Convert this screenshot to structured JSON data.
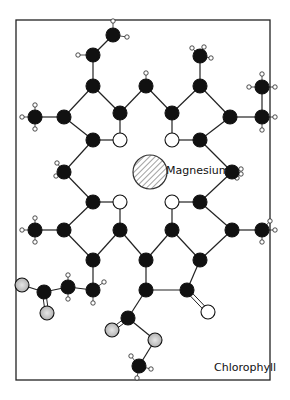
{
  "title": "Chlorophyll",
  "center_label": "Magnesium",
  "frame": {
    "x": 16,
    "y": 20,
    "w": 254,
    "h": 360
  },
  "colors": {
    "carbon": "#111111",
    "nitrogen": "#ffffff",
    "oxygen_ester": "#c8c8c8",
    "oxygen_carbonyl": "#ffffff",
    "hydrogen": "#ffffff",
    "bond": "#222222",
    "frame": "#222222"
  },
  "legend": {
    "atom_types": [
      "Carbon (black)",
      "Nitrogen (white)",
      "Oxygen (grey/white)",
      "Hydrogen (small white)",
      "Magnesium (hatched)"
    ]
  },
  "atoms": [
    {
      "id": "v2",
      "x": 113,
      "y": 35,
      "type": "C"
    },
    {
      "id": "v1",
      "x": 93,
      "y": 55,
      "type": "C"
    },
    {
      "id": "a1",
      "x": 93,
      "y": 86,
      "type": "C"
    },
    {
      "id": "a2",
      "x": 120,
      "y": 113,
      "type": "C"
    },
    {
      "id": "m1",
      "x": 146,
      "y": 86,
      "type": "C"
    },
    {
      "id": "b1",
      "x": 172,
      "y": 113,
      "type": "C"
    },
    {
      "id": "b2",
      "x": 200,
      "y": 86,
      "type": "C"
    },
    {
      "id": "bm",
      "x": 200,
      "y": 56,
      "type": "C"
    },
    {
      "id": "aM",
      "x": 35,
      "y": 117,
      "type": "C"
    },
    {
      "id": "a3",
      "x": 64,
      "y": 117,
      "type": "C"
    },
    {
      "id": "a4",
      "x": 93,
      "y": 140,
      "type": "C"
    },
    {
      "id": "nA",
      "x": 120,
      "y": 140,
      "type": "N"
    },
    {
      "id": "nB",
      "x": 172,
      "y": 140,
      "type": "N"
    },
    {
      "id": "b3",
      "x": 200,
      "y": 140,
      "type": "C"
    },
    {
      "id": "b4",
      "x": 230,
      "y": 117,
      "type": "C"
    },
    {
      "id": "e1",
      "x": 262,
      "y": 117,
      "type": "C"
    },
    {
      "id": "e2",
      "x": 262,
      "y": 87,
      "type": "C"
    },
    {
      "id": "m4",
      "x": 64,
      "y": 172,
      "type": "C"
    },
    {
      "id": "m2",
      "x": 232,
      "y": 172,
      "type": "C"
    },
    {
      "id": "d1",
      "x": 93,
      "y": 202,
      "type": "C"
    },
    {
      "id": "nD",
      "x": 120,
      "y": 202,
      "type": "N"
    },
    {
      "id": "nC",
      "x": 172,
      "y": 202,
      "type": "N"
    },
    {
      "id": "c1",
      "x": 200,
      "y": 202,
      "type": "C"
    },
    {
      "id": "dM",
      "x": 35,
      "y": 230,
      "type": "C"
    },
    {
      "id": "d2",
      "x": 64,
      "y": 230,
      "type": "C"
    },
    {
      "id": "d3",
      "x": 120,
      "y": 230,
      "type": "C"
    },
    {
      "id": "c3",
      "x": 172,
      "y": 230,
      "type": "C"
    },
    {
      "id": "c2",
      "x": 232,
      "y": 230,
      "type": "C"
    },
    {
      "id": "cM",
      "x": 262,
      "y": 230,
      "type": "C"
    },
    {
      "id": "d4",
      "x": 93,
      "y": 260,
      "type": "C"
    },
    {
      "id": "m3",
      "x": 146,
      "y": 260,
      "type": "C"
    },
    {
      "id": "c4",
      "x": 200,
      "y": 260,
      "type": "C"
    },
    {
      "id": "p1",
      "x": 93,
      "y": 290,
      "type": "C"
    },
    {
      "id": "p2",
      "x": 68,
      "y": 287,
      "type": "C"
    },
    {
      "id": "p3",
      "x": 44,
      "y": 292,
      "type": "C"
    },
    {
      "id": "pO1",
      "x": 22,
      "y": 285,
      "type": "O"
    },
    {
      "id": "pO2",
      "x": 47,
      "y": 313,
      "type": "O"
    },
    {
      "id": "e5",
      "x": 146,
      "y": 290,
      "type": "C"
    },
    {
      "id": "e6",
      "x": 187,
      "y": 290,
      "type": "C"
    },
    {
      "id": "eO",
      "x": 208,
      "y": 312,
      "type": "Ok"
    },
    {
      "id": "k1",
      "x": 128,
      "y": 318,
      "type": "C"
    },
    {
      "id": "kO1",
      "x": 112,
      "y": 330,
      "type": "O"
    },
    {
      "id": "kO2",
      "x": 155,
      "y": 340,
      "type": "O"
    },
    {
      "id": "k2",
      "x": 139,
      "y": 366,
      "type": "C"
    }
  ],
  "bonds": [
    [
      "v2",
      "v1"
    ],
    [
      "v1",
      "a1"
    ],
    [
      "a1",
      "a2"
    ],
    [
      "a2",
      "m1"
    ],
    [
      "m1",
      "b1"
    ],
    [
      "b1",
      "b2"
    ],
    [
      "b2",
      "bm"
    ],
    [
      "a1",
      "a3"
    ],
    [
      "a3",
      "aM"
    ],
    [
      "a3",
      "a4"
    ],
    [
      "a4",
      "nA"
    ],
    [
      "nA",
      "a2"
    ],
    [
      "b1",
      "nB"
    ],
    [
      "nB",
      "b3"
    ],
    [
      "b3",
      "b4"
    ],
    [
      "b4",
      "b2"
    ],
    [
      "b4",
      "e1"
    ],
    [
      "e1",
      "e2"
    ],
    [
      "a4",
      "m4"
    ],
    [
      "m4",
      "d1"
    ],
    [
      "b3",
      "m2"
    ],
    [
      "m2",
      "c1"
    ],
    [
      "d1",
      "nD"
    ],
    [
      "nD",
      "d3"
    ],
    [
      "d1",
      "d2"
    ],
    [
      "d2",
      "dM"
    ],
    [
      "d2",
      "d4"
    ],
    [
      "d4",
      "d3"
    ],
    [
      "c1",
      "nC"
    ],
    [
      "nC",
      "c3"
    ],
    [
      "c1",
      "c2"
    ],
    [
      "c2",
      "cM"
    ],
    [
      "c2",
      "c4"
    ],
    [
      "c4",
      "c3"
    ],
    [
      "d3",
      "m3"
    ],
    [
      "m3",
      "c3"
    ],
    [
      "m3",
      "e5"
    ],
    [
      "e5",
      "e6"
    ],
    [
      "e6",
      "c4"
    ],
    [
      "e5",
      "k1"
    ],
    [
      "k1",
      "kO2"
    ],
    [
      "kO2",
      "k2"
    ],
    [
      "d4",
      "p1"
    ],
    [
      "p1",
      "p2"
    ],
    [
      "p2",
      "p3"
    ],
    [
      "p3",
      "pO1"
    ]
  ],
  "double_bonds": [
    [
      "e6",
      "eO"
    ],
    [
      "k1",
      "kO1"
    ],
    [
      "p3",
      "pO2"
    ]
  ],
  "hydrogens": [
    {
      "of": "v2",
      "dx": 0,
      "dy": -14
    },
    {
      "of": "v2",
      "dx": 14,
      "dy": 2
    },
    {
      "of": "v1",
      "dx": -15,
      "dy": 0
    },
    {
      "of": "m1",
      "dx": 0,
      "dy": -13
    },
    {
      "of": "m1",
      "dx": 0,
      "dy": 0.5
    },
    {
      "of": "bm",
      "dx": -8,
      "dy": -8
    },
    {
      "of": "bm",
      "dx": 4,
      "dy": -9
    },
    {
      "of": "bm",
      "dx": 11,
      "dy": 2
    },
    {
      "of": "aM",
      "dx": 0,
      "dy": -12
    },
    {
      "of": "aM",
      "dx": -13,
      "dy": 0
    },
    {
      "of": "aM",
      "dx": 0,
      "dy": 12
    },
    {
      "of": "e2",
      "dx": 0,
      "dy": -13
    },
    {
      "of": "e2",
      "dx": -13,
      "dy": 0
    },
    {
      "of": "e2",
      "dx": 13,
      "dy": 0
    },
    {
      "of": "e1",
      "dx": 13,
      "dy": 0
    },
    {
      "of": "e1",
      "dx": 0,
      "dy": 13
    },
    {
      "of": "m4",
      "dx": -7,
      "dy": -9
    },
    {
      "of": "m4",
      "dx": -8,
      "dy": 4
    },
    {
      "of": "m2",
      "dx": 9,
      "dy": -3
    },
    {
      "of": "m2",
      "dx": 9,
      "dy": 2
    },
    {
      "of": "m2",
      "dx": 5,
      "dy": 6
    },
    {
      "of": "dM",
      "dx": 0,
      "dy": -12
    },
    {
      "of": "dM",
      "dx": -13,
      "dy": 0
    },
    {
      "of": "dM",
      "dx": 0,
      "dy": 12
    },
    {
      "of": "cM",
      "dx": 8,
      "dy": -9
    },
    {
      "of": "cM",
      "dx": 13,
      "dy": 0
    },
    {
      "of": "cM",
      "dx": 0,
      "dy": 12
    },
    {
      "of": "p2",
      "dx": 0,
      "dy": -12
    },
    {
      "of": "p2",
      "dx": 0,
      "dy": 12
    },
    {
      "of": "p1",
      "dx": 11,
      "dy": -8
    },
    {
      "of": "p1",
      "dx": 0,
      "dy": 13
    },
    {
      "of": "k2",
      "dx": -8,
      "dy": -10
    },
    {
      "of": "k2",
      "dx": 12,
      "dy": 3
    },
    {
      "of": "k2",
      "dx": -2,
      "dy": 12
    }
  ],
  "magnesium": {
    "x": 150,
    "y": 172,
    "r": 17
  }
}
